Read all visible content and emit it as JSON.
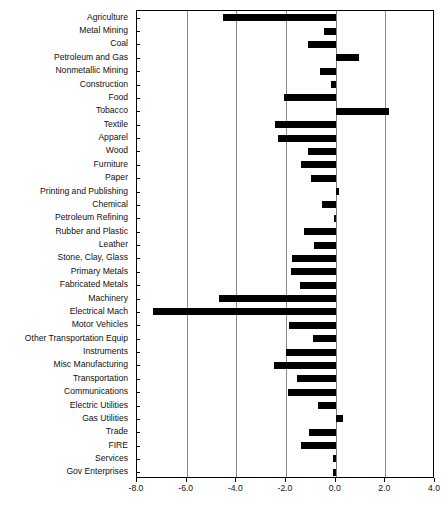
{
  "chart_data": {
    "type": "bar",
    "orientation": "horizontal",
    "title": "",
    "subtitle": "",
    "xlabel": "",
    "ylabel": "",
    "xlim": [
      -8.0,
      4.0
    ],
    "xticks": [
      -8.0,
      -6.0,
      -4.0,
      -2.0,
      0.0,
      2.0,
      4.0
    ],
    "xticklabels": [
      "-8.0",
      "-6.0",
      "-4.0",
      "-2.0",
      "0.0",
      "2.0",
      "4.0"
    ],
    "grid": true,
    "grid_axis": "x",
    "legend": null,
    "bar_color": "#000000",
    "frame_color": "#000000",
    "grid_color": "#8a8a8a",
    "categories": [
      "Agriculture",
      "Metal Mining",
      "Coal",
      "Petroleum and Gas",
      "Nonmetallic Mining",
      "Construction",
      "Food",
      "Tobacco",
      "Textile",
      "Apparel",
      "Wood",
      "Furniture",
      "Paper",
      "Printing and Publishing",
      "Chemical",
      "Petroleum Refining",
      "Rubber and Plastic",
      "Leather",
      "Stone, Clay, Glass",
      "Primary Metals",
      "Fabricated Metals",
      "Machinery",
      "Electrical Mach",
      "Motor Vehicles",
      "Other Transportation Equip",
      "Instruments",
      "Misc Manufacturing",
      "Transportation",
      "Communications",
      "Electric Utilities",
      "Gas Utilities",
      "Trade",
      "FIRE",
      "Services",
      "Gov Enterprises"
    ],
    "values": [
      -4.55,
      -0.48,
      -1.13,
      0.93,
      -0.64,
      -0.2,
      -2.1,
      2.14,
      -2.45,
      -2.33,
      -1.13,
      -1.41,
      -1.01,
      0.15,
      -0.56,
      -0.05,
      -1.28,
      -0.89,
      -1.75,
      -1.82,
      -1.45,
      -4.71,
      -7.34,
      -1.89,
      -0.93,
      -2.01,
      -2.49,
      -1.57,
      -1.93,
      -0.73,
      0.28,
      -1.09,
      -1.41,
      -0.12,
      -0.1
    ]
  }
}
